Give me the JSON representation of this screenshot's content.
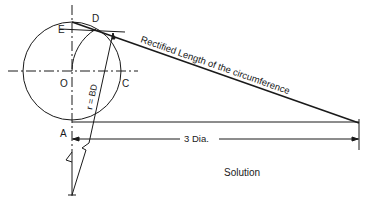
{
  "diagram": {
    "caption": "Solution",
    "points": {
      "O": "O",
      "C": "C",
      "D": "D",
      "E": "E",
      "A": "A"
    },
    "radius_label": "r = BD",
    "rectified_label": "Rectified Length of the circumference",
    "dimension_label": "3 Dia.",
    "colors": {
      "line": "#1a1a1a",
      "background": "#ffffff"
    }
  }
}
